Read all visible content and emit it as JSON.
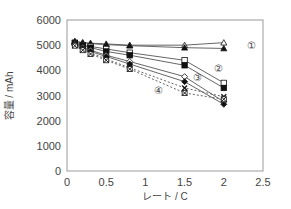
{
  "chart_data": {
    "type": "line",
    "title": "",
    "xlabel": "レート / C",
    "ylabel": "容量 / mAh",
    "xlim": [
      0,
      2.5
    ],
    "ylim": [
      0,
      6000
    ],
    "xticks": [
      "0",
      "0.5",
      "1",
      "1.5",
      "2",
      "2.5"
    ],
    "yticks": [
      "0",
      "1000",
      "2000",
      "3000",
      "4000",
      "5000",
      "6000"
    ],
    "grid": false,
    "legend": "none",
    "annotations": [
      {
        "text": "①",
        "x": 2.35,
        "y": 5000
      },
      {
        "text": "②",
        "x": 1.93,
        "y": 4100
      },
      {
        "text": "③",
        "x": 1.67,
        "y": 3750
      },
      {
        "text": "④",
        "x": 1.17,
        "y": 3200
      }
    ],
    "series": [
      {
        "name": "①a",
        "group": "①",
        "marker": "triangle-open",
        "dash": false,
        "x": [
          0.1,
          0.2,
          0.3,
          0.5,
          0.8,
          1.5,
          2.0
        ],
        "y": [
          5150,
          5100,
          5080,
          5050,
          5000,
          5000,
          5100
        ]
      },
      {
        "name": "①b",
        "group": "①",
        "marker": "triangle-filled",
        "dash": false,
        "x": [
          0.1,
          0.2,
          0.3,
          0.5,
          0.8,
          1.5,
          2.0
        ],
        "y": [
          5150,
          5100,
          5060,
          5020,
          4980,
          4900,
          4870
        ]
      },
      {
        "name": "②a",
        "group": "②",
        "marker": "square-open",
        "dash": false,
        "x": [
          0.1,
          0.2,
          0.3,
          0.5,
          0.8,
          1.5,
          2.0
        ],
        "y": [
          5100,
          5000,
          4950,
          4850,
          4700,
          4400,
          3500
        ]
      },
      {
        "name": "②b",
        "group": "②",
        "marker": "square-filled",
        "dash": false,
        "x": [
          0.1,
          0.2,
          0.3,
          0.5,
          0.8,
          1.5,
          2.0
        ],
        "y": [
          5080,
          4980,
          4900,
          4750,
          4600,
          4200,
          3300
        ]
      },
      {
        "name": "③a",
        "group": "③",
        "marker": "diamond-open",
        "dash": false,
        "x": [
          0.1,
          0.2,
          0.3,
          0.5,
          0.8,
          1.5,
          2.0
        ],
        "y": [
          5050,
          4920,
          4800,
          4600,
          4350,
          3750,
          2750
        ]
      },
      {
        "name": "③b",
        "group": "③",
        "marker": "diamond-filled",
        "dash": false,
        "x": [
          0.1,
          0.2,
          0.3,
          0.5,
          0.8,
          1.5,
          2.0
        ],
        "y": [
          5020,
          4880,
          4750,
          4550,
          4250,
          3550,
          2650
        ]
      },
      {
        "name": "④a",
        "group": "④",
        "marker": "cross",
        "dash": true,
        "x": [
          0.1,
          0.2,
          0.3,
          0.5,
          0.8,
          1.5,
          2.0
        ],
        "y": [
          5000,
          4850,
          4700,
          4450,
          4100,
          3300,
          2950
        ]
      },
      {
        "name": "④b",
        "group": "④",
        "marker": "cross-box",
        "dash": true,
        "x": [
          0.1,
          0.2,
          0.3,
          0.5,
          0.8,
          1.5,
          2.0
        ],
        "y": [
          4980,
          4800,
          4650,
          4400,
          4050,
          3100,
          2850
        ]
      }
    ]
  },
  "colors": {
    "axis": "#9a9a9a",
    "text": "#444444",
    "line": "#555555",
    "marker": "#111111"
  }
}
